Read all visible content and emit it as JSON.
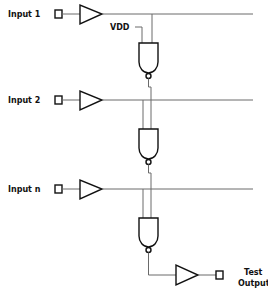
{
  "diagram": {
    "type": "scan-chain-test-circuit",
    "inputs": [
      {
        "label": "Input 1"
      },
      {
        "label": "Input 2"
      },
      {
        "label": "Input n"
      }
    ],
    "supply_label": "VDD",
    "output": {
      "label_line1": "Test",
      "label_line2": "Output"
    },
    "gates": [
      {
        "type": "NAND",
        "inputs": [
          "VDD",
          "Input 1"
        ]
      },
      {
        "type": "NAND",
        "inputs": [
          "Input 2",
          "gate 1 output"
        ]
      },
      {
        "type": "NAND",
        "inputs": [
          "Input n",
          "gate 2 output"
        ]
      }
    ],
    "colors": {
      "wire": "#6a6a6a",
      "shape": "#111111",
      "background": "#ffffff"
    }
  }
}
